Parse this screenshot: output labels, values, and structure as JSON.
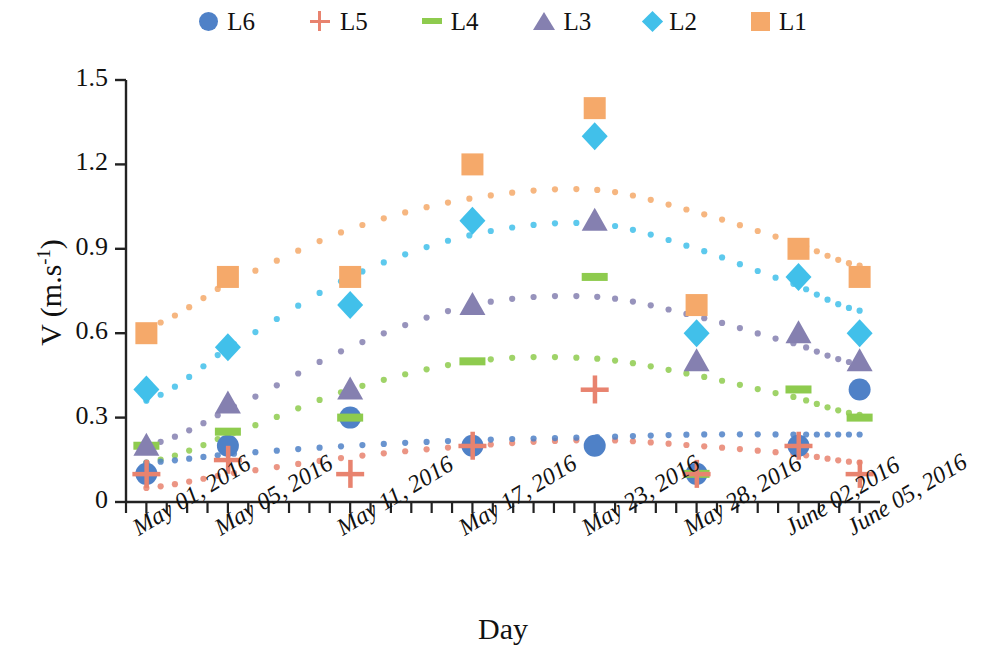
{
  "legend": {
    "position": "top",
    "items": [
      {
        "label": "L6",
        "marker": "circle",
        "color": "#4f81c7"
      },
      {
        "label": "L5",
        "marker": "plus",
        "color": "#e8836f"
      },
      {
        "label": "L4",
        "marker": "dash",
        "color": "#8ecb4e"
      },
      {
        "label": "L3",
        "marker": "triangle",
        "color": "#8580b0"
      },
      {
        "label": "L2",
        "marker": "diamond",
        "color": "#41c0ea"
      },
      {
        "label": "L1",
        "marker": "square",
        "color": "#f5a96a"
      }
    ]
  },
  "axes": {
    "y_title_main": "V (m.s",
    "y_title_sup": "-1",
    "y_title_close": ")",
    "y_title_full": "V (m.s-1)",
    "x_title": "Day",
    "y_ticks": [
      "0",
      "0.3",
      "0.6",
      "0.9",
      "1.2",
      "1.5"
    ],
    "x_ticks": [
      "May 01, 2016",
      "May 05, 2016",
      "May 11, 2016",
      "May 17, 2016",
      "May 23, 2016",
      "May 28, 2016",
      "June 02,2016",
      "June 05, 2016"
    ]
  },
  "chart_data": {
    "type": "scatter",
    "title": "",
    "xlabel": "Day",
    "ylabel": "V (m.s-1)",
    "ylim": [
      0,
      1.5
    ],
    "ytick_values": [
      0,
      0.3,
      0.6,
      0.9,
      1.2,
      1.5
    ],
    "grid": false,
    "legend_position": "top",
    "categories": [
      "May 01, 2016",
      "May 05, 2016",
      "May 11, 2016",
      "May 17, 2016",
      "May 23, 2016",
      "May 28, 2016",
      "June 02,2016",
      "June 05, 2016"
    ],
    "x_positions": [
      1,
      5,
      11,
      17,
      23,
      28,
      33,
      36
    ],
    "series": [
      {
        "name": "L1",
        "marker": "square",
        "color": "#f5a96a",
        "values": [
          0.6,
          0.8,
          0.8,
          1.2,
          1.4,
          0.7,
          0.9,
          0.8
        ],
        "trend": [
          0.62,
          0.78,
          0.97,
          1.08,
          1.11,
          1.03,
          0.92,
          0.84
        ]
      },
      {
        "name": "L2",
        "marker": "diamond",
        "color": "#41c0ea",
        "values": [
          0.4,
          0.55,
          0.7,
          1.0,
          1.3,
          0.6,
          0.8,
          0.6
        ],
        "trend": [
          0.36,
          0.55,
          0.8,
          0.95,
          0.99,
          0.9,
          0.77,
          0.68
        ]
      },
      {
        "name": "L3",
        "marker": "triangle",
        "color": "#8580b0",
        "values": [
          0.2,
          0.35,
          0.4,
          0.7,
          1.0,
          0.5,
          0.6,
          0.5
        ],
        "trend": [
          0.2,
          0.33,
          0.55,
          0.7,
          0.73,
          0.66,
          0.56,
          0.49
        ]
      },
      {
        "name": "L4",
        "marker": "dash",
        "color": "#8ecb4e",
        "values": [
          0.2,
          0.25,
          0.3,
          0.5,
          0.8,
          0.1,
          0.4,
          0.3
        ],
        "trend": [
          0.14,
          0.24,
          0.4,
          0.5,
          0.51,
          0.45,
          0.37,
          0.31
        ]
      },
      {
        "name": "L5",
        "marker": "plus",
        "color": "#e8836f",
        "values": [
          0.1,
          0.15,
          0.1,
          0.2,
          0.4,
          0.1,
          0.2,
          0.1
        ],
        "trend": [
          0.05,
          0.1,
          0.16,
          0.2,
          0.22,
          0.2,
          0.17,
          0.14
        ]
      },
      {
        "name": "L6",
        "marker": "circle",
        "color": "#4f81c7",
        "values": [
          0.1,
          0.2,
          0.3,
          0.2,
          0.2,
          0.1,
          0.2,
          0.4
        ],
        "trend": [
          0.14,
          0.17,
          0.2,
          0.22,
          0.23,
          0.24,
          0.24,
          0.24
        ]
      }
    ]
  }
}
